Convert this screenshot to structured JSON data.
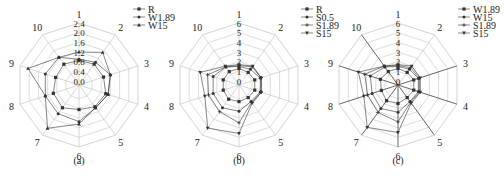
{
  "figure": {
    "panels": [
      "(a)",
      "(b)",
      "(c)"
    ]
  },
  "style": {
    "grid_color": "#c8c8c8",
    "spoke_color": "#bdbdbd",
    "series_color": "#333333",
    "bold_spoke_color": "#555555"
  },
  "chart_data": [
    {
      "type": "radar",
      "panel_label": "(a)",
      "axes": [
        "1",
        "2",
        "3",
        "4",
        "5",
        "6",
        "7",
        "8",
        "9",
        "10"
      ],
      "radial_ticks": [
        "0.0",
        "0.4",
        "0.8",
        "1.2",
        "1.6",
        "2.0",
        "2.4"
      ],
      "rlim": [
        0,
        2.4
      ],
      "grid": true,
      "legend_position": "top-right",
      "series": [
        {
          "name": "R",
          "marker": "square",
          "values": [
            0.85,
            0.9,
            0.9,
            1.0,
            0.95,
            0.85,
            1.0,
            0.95,
            0.85,
            0.9
          ]
        },
        {
          "name": "W1.89",
          "marker": "circle",
          "values": [
            0.9,
            1.0,
            1.2,
            1.1,
            1.0,
            1.35,
            1.3,
            1.3,
            1.3,
            1.25
          ]
        },
        {
          "name": "W15",
          "marker": "triangle",
          "values": [
            1.2,
            1.5,
            1.2,
            1.1,
            1.0,
            1.45,
            2.05,
            1.3,
            2.05,
            1.25
          ]
        }
      ]
    },
    {
      "type": "radar",
      "panel_label": "(b)",
      "axes": [
        "1",
        "2",
        "3",
        "4",
        "5",
        "6",
        "7",
        "8",
        "9",
        "10"
      ],
      "radial_ticks": [
        "0",
        "1",
        "2",
        "3",
        "4",
        "5",
        "6"
      ],
      "rlim": [
        0,
        6
      ],
      "grid": true,
      "legend_position": "top-right",
      "series": [
        {
          "name": "R",
          "marker": "square",
          "values": [
            1.3,
            1.2,
            1.3,
            1.3,
            1.2,
            1.3,
            1.4,
            1.3,
            1.3,
            1.3
          ]
        },
        {
          "name": "S0.5",
          "marker": "circle",
          "values": [
            1.5,
            1.6,
            1.9,
            1.9,
            1.7,
            2.3,
            2.5,
            2.4,
            2.4,
            1.9
          ]
        },
        {
          "name": "S1.89",
          "marker": "plus",
          "values": [
            1.6,
            1.9,
            2.0,
            2.0,
            1.8,
            3.5,
            3.0,
            2.9,
            3.0,
            1.9
          ]
        },
        {
          "name": "S15",
          "marker": "triangle-down",
          "values": [
            1.7,
            2.0,
            2.0,
            2.0,
            1.9,
            4.6,
            5.1,
            3.3,
            3.8,
            2.0
          ]
        }
      ]
    },
    {
      "type": "radar",
      "panel_label": "(c)",
      "axes": [
        "1",
        "2",
        "3",
        "4",
        "5",
        "6",
        "7",
        "8",
        "9",
        "10"
      ],
      "radial_ticks": [
        "0",
        "1",
        "2",
        "3",
        "4",
        "5",
        "6"
      ],
      "rlim": [
        0,
        6
      ],
      "grid": true,
      "legend_position": "top-right",
      "series": [
        {
          "name": "W1.89",
          "marker": "square",
          "values": [
            1.3,
            1.2,
            1.3,
            1.3,
            1.2,
            1.5,
            1.6,
            1.4,
            1.5,
            1.3
          ]
        },
        {
          "name": "W15",
          "marker": "circle",
          "values": [
            1.5,
            1.6,
            1.8,
            1.8,
            1.7,
            2.4,
            2.6,
            2.4,
            2.6,
            1.9
          ]
        },
        {
          "name": "S1.89",
          "marker": "plus",
          "values": [
            1.6,
            1.8,
            1.9,
            1.9,
            1.8,
            3.4,
            3.1,
            2.9,
            3.2,
            2.0
          ]
        },
        {
          "name": "S15",
          "marker": "triangle-down",
          "values": [
            1.7,
            2.0,
            2.0,
            2.0,
            1.9,
            4.5,
            5.0,
            3.3,
            3.9,
            2.0
          ]
        }
      ]
    }
  ]
}
